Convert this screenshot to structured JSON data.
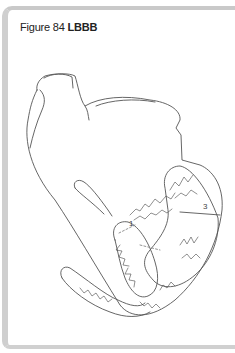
{
  "figure": {
    "number_label": "Figure 84",
    "title": "LBBB"
  },
  "diagram": {
    "labels": [
      "1",
      "3"
    ],
    "line_color": "#555555"
  }
}
